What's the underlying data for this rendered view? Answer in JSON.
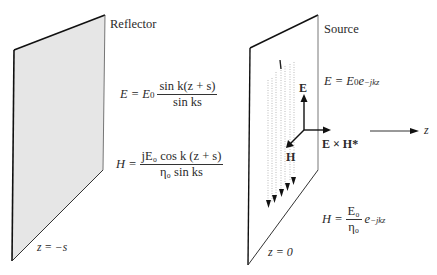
{
  "reflector": {
    "label": "Reflector",
    "position_label": "z = −s",
    "e_eq": {
      "lhs": "E = E",
      "sub": "0",
      "num": "sin k(z + s)",
      "den": "sin ks"
    },
    "h_eq": {
      "lhs": "H =",
      "num": "jE₀ cos k (z + s)",
      "den": "η₀ sin ks"
    },
    "fill": "#e8e8e8"
  },
  "source": {
    "label": "Source",
    "position_label": "z = 0",
    "current_label": "I",
    "e_eq": {
      "lhs": "E = E",
      "sub": "0",
      "exp_base": "e",
      "exp": "−jkz"
    },
    "h_eq": {
      "lhs": "H =",
      "num": "E₀",
      "den": "η₀",
      "exp_base": "e",
      "exp": "−jkz"
    }
  },
  "axes": {
    "e_label": "E",
    "h_label": "H",
    "poynting_label": "E × H*",
    "z_label": "z"
  }
}
